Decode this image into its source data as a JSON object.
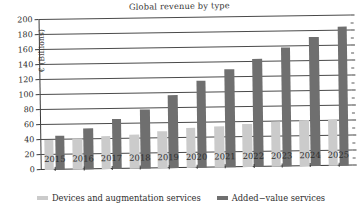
{
  "chart_data": {
    "type": "bar",
    "title": "Global revenue by type",
    "xlabel": "",
    "ylabel": "€ (Billions)",
    "categories": [
      "2015",
      "2016",
      "2017",
      "2018",
      "2019",
      "2020",
      "2021",
      "2022",
      "2023",
      "2024",
      "2025"
    ],
    "series": [
      {
        "name": "Devices and augmentation services",
        "color": "#cbcbcb",
        "values": [
          40,
          42,
          44,
          46,
          50,
          54,
          55,
          58,
          60,
          62,
          62
        ]
      },
      {
        "name": "Added−value services",
        "color": "#6f6f6f",
        "values": [
          46,
          55,
          67,
          79,
          98,
          116,
          131,
          144,
          159,
          172,
          186
        ]
      }
    ],
    "ylim": [
      0,
      200
    ],
    "yticks": [
      0,
      20,
      40,
      60,
      80,
      100,
      120,
      140,
      160,
      180,
      200
    ],
    "ytick_labels": [
      "0",
      "20",
      "40",
      "60",
      "80",
      "100",
      "120",
      "140",
      "160",
      "180",
      "200"
    ],
    "grid": true,
    "legend_position": "bottom"
  },
  "legend": {
    "entries": [
      {
        "label": "Devices and augmentation services"
      },
      {
        "label": "Added−value services"
      }
    ]
  }
}
